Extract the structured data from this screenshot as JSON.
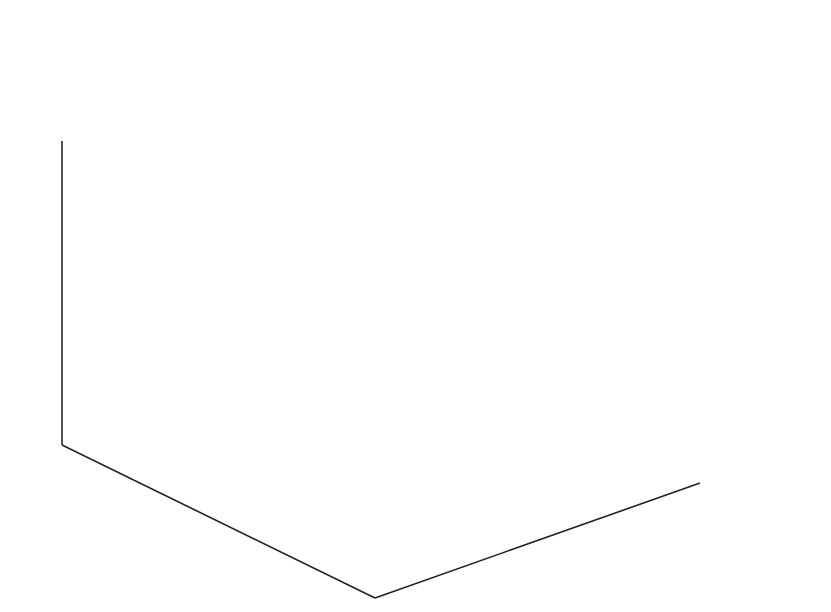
{
  "chart_data": {
    "type": "ribbon",
    "function": "peaks",
    "xlabel": "",
    "ylabel": "",
    "zlabel": "",
    "axes": {
      "x": {
        "range": [
          0,
          50
        ],
        "ticks": [
          0,
          10,
          20,
          30,
          40,
          50
        ]
      },
      "y": {
        "range": [
          0,
          60
        ],
        "ticks": [
          0,
          20,
          40,
          60
        ]
      },
      "z": {
        "range": [
          -10,
          10
        ],
        "ticks": [
          -10,
          -5,
          0,
          5,
          10
        ]
      }
    },
    "grid": "dotted",
    "view": "3D default (azimuth -37.5, elevation 30)",
    "colormap": "grayscale",
    "ribbon_count": 49,
    "points_per_ribbon": 49,
    "features": [
      {
        "label": "main peak",
        "z_max": 8.1
      },
      {
        "label": "secondary peak",
        "z_max": 3.8
      },
      {
        "label": "deep trough",
        "z_min": -6.5
      }
    ]
  },
  "axis_labels": {
    "z": [
      "10",
      "5",
      "0",
      "−5",
      "−10"
    ],
    "y": [
      "60",
      "40",
      "20",
      "0"
    ],
    "x": [
      "0",
      "10",
      "20",
      "30",
      "40",
      "50"
    ]
  }
}
